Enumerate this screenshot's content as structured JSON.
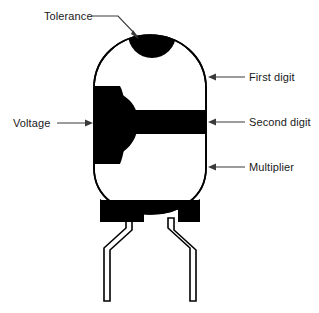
{
  "figure": {
    "component": "radial ceramic disc capacitor with two leads",
    "background_color": "#ffffff",
    "ink_color": "#000000",
    "callout_line_color": "#3a3a3a"
  },
  "labels": {
    "tolerance": "Tolerance",
    "voltage": "Voltage",
    "first_digit": "First digit",
    "second_digit": "Second digit",
    "multiplier": "Multiplier"
  },
  "bands": [
    {
      "name": "tolerance",
      "label": "Tolerance",
      "position": "top cap",
      "fill": "#000000"
    },
    {
      "name": "first-digit",
      "label": "First digit",
      "position": "upper body",
      "fill": "#ffffff"
    },
    {
      "name": "second-digit",
      "label": "Second digit",
      "position": "middle stripe",
      "fill": "#000000"
    },
    {
      "name": "multiplier",
      "label": "Multiplier",
      "position": "lower body",
      "fill": "#ffffff"
    },
    {
      "name": "voltage",
      "label": "Voltage",
      "position": "left side blob",
      "fill": "#000000"
    }
  ],
  "leads": {
    "count": 2,
    "style": "outlined bent radial leads"
  }
}
